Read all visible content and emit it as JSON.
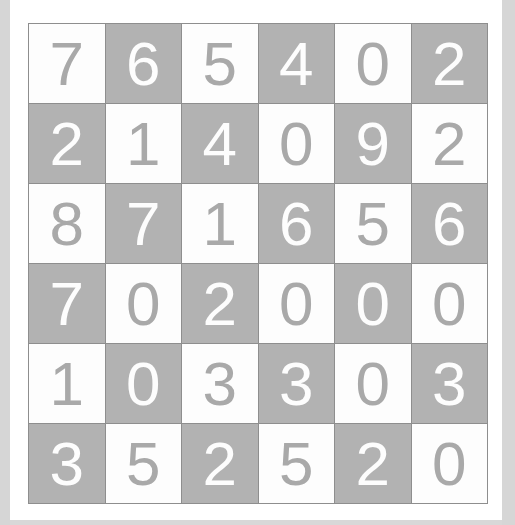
{
  "page": {
    "background_color": "#d8d8d8",
    "card_background_color": "#ffffff"
  },
  "heading": {
    "text": "6 x 6 Grid"
  },
  "grid": {
    "rows": 6,
    "columns": 6,
    "light_cell_color": "#fdfdfd",
    "dark_cell_color": "#b2b2b2",
    "light_cell_text_color": "#a9a9a9",
    "dark_cell_text_color": "#fdfdfd",
    "border_color": "#8e8e8e",
    "cells": [
      [
        {
          "value": "7",
          "shade": "light"
        },
        {
          "value": "6",
          "shade": "dark"
        },
        {
          "value": "5",
          "shade": "light"
        },
        {
          "value": "4",
          "shade": "dark"
        },
        {
          "value": "0",
          "shade": "light"
        },
        {
          "value": "2",
          "shade": "dark"
        }
      ],
      [
        {
          "value": "2",
          "shade": "dark"
        },
        {
          "value": "1",
          "shade": "light"
        },
        {
          "value": "4",
          "shade": "dark"
        },
        {
          "value": "0",
          "shade": "light"
        },
        {
          "value": "9",
          "shade": "dark"
        },
        {
          "value": "2",
          "shade": "light"
        }
      ],
      [
        {
          "value": "8",
          "shade": "light"
        },
        {
          "value": "7",
          "shade": "dark"
        },
        {
          "value": "1",
          "shade": "light"
        },
        {
          "value": "6",
          "shade": "dark"
        },
        {
          "value": "5",
          "shade": "light"
        },
        {
          "value": "6",
          "shade": "dark"
        }
      ],
      [
        {
          "value": "7",
          "shade": "dark"
        },
        {
          "value": "0",
          "shade": "light"
        },
        {
          "value": "2",
          "shade": "dark"
        },
        {
          "value": "0",
          "shade": "light"
        },
        {
          "value": "0",
          "shade": "dark"
        },
        {
          "value": "0",
          "shade": "light"
        }
      ],
      [
        {
          "value": "1",
          "shade": "light"
        },
        {
          "value": "0",
          "shade": "dark"
        },
        {
          "value": "3",
          "shade": "light"
        },
        {
          "value": "3",
          "shade": "dark"
        },
        {
          "value": "0",
          "shade": "light"
        },
        {
          "value": "3",
          "shade": "dark"
        }
      ],
      [
        {
          "value": "3",
          "shade": "dark"
        },
        {
          "value": "5",
          "shade": "light"
        },
        {
          "value": "2",
          "shade": "dark"
        },
        {
          "value": "5",
          "shade": "light"
        },
        {
          "value": "2",
          "shade": "dark"
        },
        {
          "value": "0",
          "shade": "light"
        }
      ]
    ]
  }
}
